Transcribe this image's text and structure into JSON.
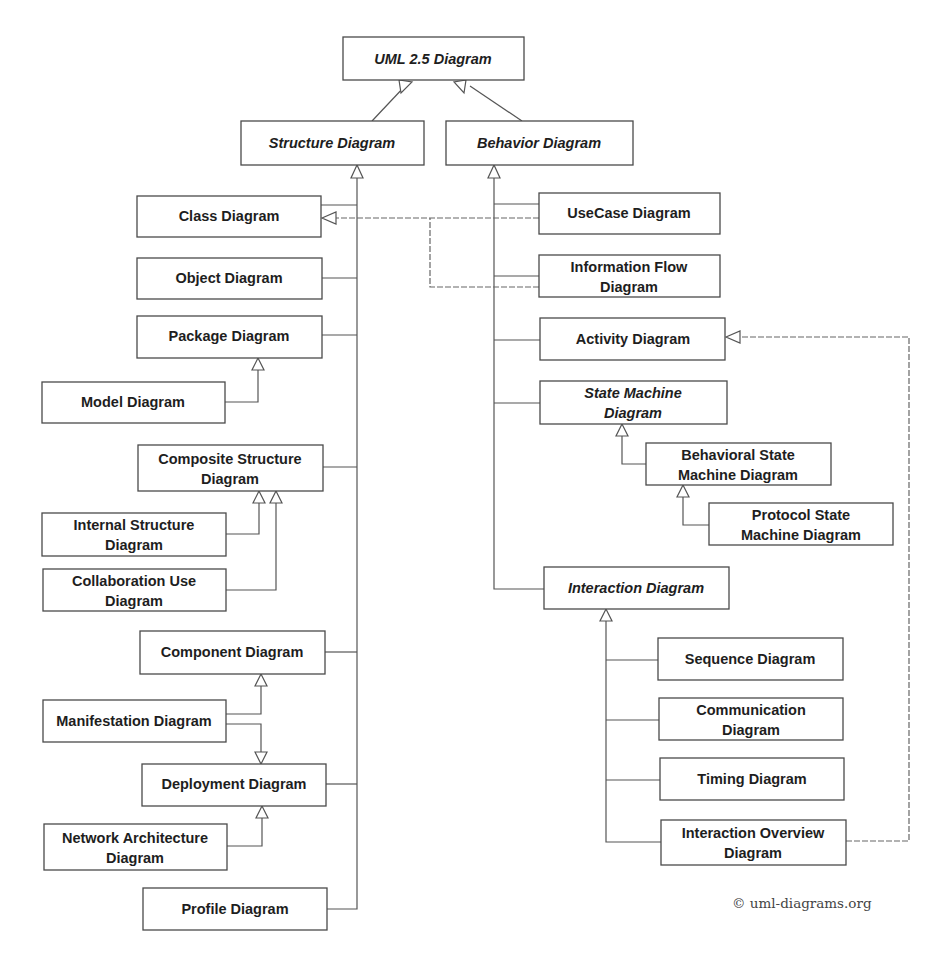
{
  "diagram": {
    "title": "UML 2.5 Diagram",
    "copyright": "© uml-diagrams.org",
    "nodes": {
      "uml": {
        "lines": [
          "UML 2.5 Diagram"
        ],
        "abstract": true
      },
      "structure": {
        "lines": [
          "Structure Diagram"
        ],
        "abstract": true
      },
      "behavior": {
        "lines": [
          "Behavior Diagram"
        ],
        "abstract": true
      },
      "class": {
        "lines": [
          "Class Diagram"
        ],
        "abstract": false
      },
      "object": {
        "lines": [
          "Object Diagram"
        ],
        "abstract": false
      },
      "package": {
        "lines": [
          "Package Diagram"
        ],
        "abstract": false
      },
      "model": {
        "lines": [
          "Model Diagram"
        ],
        "abstract": false
      },
      "composite": {
        "lines": [
          "Composite Structure",
          "Diagram"
        ],
        "abstract": false
      },
      "internal": {
        "lines": [
          "Internal Structure",
          "Diagram"
        ],
        "abstract": false
      },
      "collaboration": {
        "lines": [
          "Collaboration Use",
          "Diagram"
        ],
        "abstract": false
      },
      "component": {
        "lines": [
          "Component Diagram"
        ],
        "abstract": false
      },
      "manifestation": {
        "lines": [
          "Manifestation Diagram"
        ],
        "abstract": false
      },
      "deployment": {
        "lines": [
          "Deployment Diagram"
        ],
        "abstract": false
      },
      "network": {
        "lines": [
          "Network Architecture",
          "Diagram"
        ],
        "abstract": false
      },
      "profile": {
        "lines": [
          "Profile Diagram"
        ],
        "abstract": false
      },
      "usecase": {
        "lines": [
          "UseCase Diagram"
        ],
        "abstract": false
      },
      "infoflow": {
        "lines": [
          "Information Flow",
          "Diagram"
        ],
        "abstract": false
      },
      "activity": {
        "lines": [
          "Activity Diagram"
        ],
        "abstract": false
      },
      "statemachine": {
        "lines": [
          "State Machine",
          "Diagram"
        ],
        "abstract": true
      },
      "behavioralstate": {
        "lines": [
          "Behavioral State",
          "Machine Diagram"
        ],
        "abstract": false
      },
      "protocolstate": {
        "lines": [
          "Protocol State",
          "Machine Diagram"
        ],
        "abstract": false
      },
      "interaction": {
        "lines": [
          "Interaction Diagram"
        ],
        "abstract": true
      },
      "sequence": {
        "lines": [
          "Sequence Diagram"
        ],
        "abstract": false
      },
      "communication": {
        "lines": [
          "Communication",
          "Diagram"
        ],
        "abstract": false
      },
      "timing": {
        "lines": [
          "Timing Diagram"
        ],
        "abstract": false
      },
      "interactionoverview": {
        "lines": [
          "Interaction Overview",
          "Diagram"
        ],
        "abstract": false
      }
    },
    "relationships": [
      {
        "from": "Structure Diagram",
        "to": "UML 2.5 Diagram",
        "type": "generalization"
      },
      {
        "from": "Behavior Diagram",
        "to": "UML 2.5 Diagram",
        "type": "generalization"
      },
      {
        "from": "Class Diagram",
        "to": "Structure Diagram",
        "type": "generalization"
      },
      {
        "from": "Object Diagram",
        "to": "Structure Diagram",
        "type": "generalization"
      },
      {
        "from": "Package Diagram",
        "to": "Structure Diagram",
        "type": "generalization"
      },
      {
        "from": "Model Diagram",
        "to": "Package Diagram",
        "type": "generalization"
      },
      {
        "from": "Composite Structure Diagram",
        "to": "Structure Diagram",
        "type": "generalization"
      },
      {
        "from": "Internal Structure Diagram",
        "to": "Composite Structure Diagram",
        "type": "generalization"
      },
      {
        "from": "Collaboration Use Diagram",
        "to": "Composite Structure Diagram",
        "type": "generalization"
      },
      {
        "from": "Component Diagram",
        "to": "Structure Diagram",
        "type": "generalization"
      },
      {
        "from": "Manifestation Diagram",
        "to": "Component Diagram",
        "type": "generalization"
      },
      {
        "from": "Manifestation Diagram",
        "to": "Deployment Diagram",
        "type": "generalization"
      },
      {
        "from": "Deployment Diagram",
        "to": "Structure Diagram",
        "type": "generalization"
      },
      {
        "from": "Network Architecture Diagram",
        "to": "Deployment Diagram",
        "type": "generalization"
      },
      {
        "from": "Profile Diagram",
        "to": "Structure Diagram",
        "type": "generalization"
      },
      {
        "from": "UseCase Diagram",
        "to": "Behavior Diagram",
        "type": "generalization"
      },
      {
        "from": "UseCase Diagram",
        "to": "Class Diagram",
        "type": "generalization"
      },
      {
        "from": "Information Flow Diagram",
        "to": "Behavior Diagram",
        "type": "generalization"
      },
      {
        "from": "Information Flow Diagram",
        "to": "Class Diagram",
        "type": "generalization"
      },
      {
        "from": "Activity Diagram",
        "to": "Behavior Diagram",
        "type": "generalization"
      },
      {
        "from": "State Machine Diagram",
        "to": "Behavior Diagram",
        "type": "generalization"
      },
      {
        "from": "Behavioral State Machine Diagram",
        "to": "State Machine Diagram",
        "type": "generalization"
      },
      {
        "from": "Protocol State Machine Diagram",
        "to": "Behavioral State Machine Diagram",
        "type": "generalization"
      },
      {
        "from": "Interaction Diagram",
        "to": "Behavior Diagram",
        "type": "generalization"
      },
      {
        "from": "Sequence Diagram",
        "to": "Interaction Diagram",
        "type": "generalization"
      },
      {
        "from": "Communication Diagram",
        "to": "Interaction Diagram",
        "type": "generalization"
      },
      {
        "from": "Timing Diagram",
        "to": "Interaction Diagram",
        "type": "generalization"
      },
      {
        "from": "Interaction Overview Diagram",
        "to": "Interaction Diagram",
        "type": "generalization"
      },
      {
        "from": "Interaction Overview Diagram",
        "to": "Activity Diagram",
        "type": "generalization"
      }
    ]
  }
}
